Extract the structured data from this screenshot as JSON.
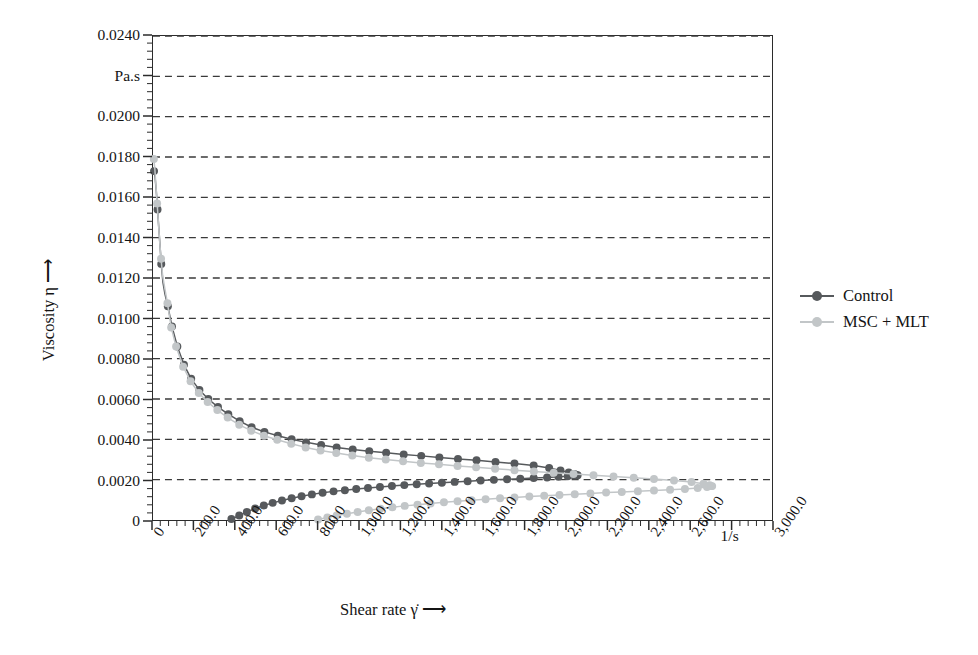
{
  "chart_data": {
    "type": "line",
    "title": "",
    "xlabel": "Shear rate γ̇  ⟶",
    "ylabel": "Viscosity η  ⟶",
    "x_unit": "1/s",
    "y_unit": "Pa.s",
    "xlim": [
      0,
      3000
    ],
    "ylim": [
      0,
      0.024
    ],
    "x_major_step": 200,
    "x_minor_per_major": 5,
    "y_major_step": 0.002,
    "y_minor_per_major": 4,
    "grid": "horizontal-dashed",
    "legend_position": "right",
    "xticklabels": [
      "0",
      "200.0",
      "400.0",
      "600.0",
      "800.0",
      "1,000.0",
      "1,200.0",
      "1,400.0",
      "1,600.0",
      "1,800.0",
      "2,000.0",
      "2,200.0",
      "2,400.0",
      "2,600.0",
      "1/s",
      "3,000.0"
    ],
    "xtickvalues": [
      0,
      200,
      400,
      600,
      800,
      1000,
      1200,
      1400,
      1600,
      1800,
      2000,
      2200,
      2400,
      2600,
      2800,
      3000
    ],
    "yticklabels": [
      "0",
      "0.0020",
      "0.0040",
      "0.0060",
      "0.0080",
      "0.0100",
      "0.0120",
      "0.0140",
      "0.0160",
      "0.0180",
      "0.0200",
      "Pa.s",
      "0.0240"
    ],
    "ytickvalues": [
      0,
      0.002,
      0.004,
      0.006,
      0.008,
      0.01,
      0.012,
      0.014,
      0.016,
      0.018,
      0.02,
      0.022,
      0.024
    ],
    "colors": {
      "control": "#56595c",
      "msc_mlt": "#c2c6c8",
      "axis": "#2b2b2b",
      "grid": "#3a3a3a",
      "text": "#141414",
      "background": "#ffffff"
    },
    "series": [
      {
        "name": "Control",
        "color": "#56595c",
        "branch": "down-sweep (ramp down)",
        "points": [
          [
            5,
            0.0173
          ],
          [
            10,
            0.017
          ],
          [
            16,
            0.0163
          ],
          [
            22,
            0.0154
          ],
          [
            28,
            0.0145
          ],
          [
            34,
            0.0136
          ],
          [
            40,
            0.0127
          ],
          [
            48,
            0.0118
          ],
          [
            58,
            0.0112
          ],
          [
            72,
            0.0106
          ],
          [
            92,
            0.0096
          ],
          [
            118,
            0.0086
          ],
          [
            150,
            0.0077
          ],
          [
            185,
            0.007
          ],
          [
            225,
            0.00645
          ],
          [
            268,
            0.006
          ],
          [
            315,
            0.0056
          ],
          [
            365,
            0.00525
          ],
          [
            420,
            0.0049
          ],
          [
            478,
            0.0046
          ],
          [
            540,
            0.00437
          ],
          [
            605,
            0.00418
          ],
          [
            672,
            0.004
          ],
          [
            742,
            0.00385
          ],
          [
            815,
            0.00372
          ],
          [
            890,
            0.0036
          ],
          [
            968,
            0.0035
          ],
          [
            1048,
            0.00341
          ],
          [
            1130,
            0.00333
          ],
          [
            1215,
            0.00325
          ],
          [
            1300,
            0.00318
          ],
          [
            1388,
            0.0031
          ],
          [
            1478,
            0.00303
          ],
          [
            1568,
            0.00296
          ],
          [
            1660,
            0.00288
          ],
          [
            1752,
            0.0028
          ],
          [
            1845,
            0.0027
          ],
          [
            1920,
            0.00258
          ],
          [
            1975,
            0.00246
          ],
          [
            2015,
            0.00235
          ],
          [
            2042,
            0.00228
          ],
          [
            2055,
            0.00222
          ]
        ]
      },
      {
        "name": "Control",
        "color": "#56595c",
        "branch": "up-sweep (ramp up)",
        "points": [
          [
            380,
            5e-05
          ],
          [
            418,
            0.00022
          ],
          [
            455,
            0.0004
          ],
          [
            495,
            0.00057
          ],
          [
            537,
            0.00072
          ],
          [
            580,
            0.00085
          ],
          [
            625,
            0.00097
          ],
          [
            672,
            0.00108
          ],
          [
            720,
            0.00118
          ],
          [
            770,
            0.00127
          ],
          [
            822,
            0.00135
          ],
          [
            875,
            0.00142
          ],
          [
            930,
            0.00148
          ],
          [
            985,
            0.00154
          ],
          [
            1042,
            0.00159
          ],
          [
            1100,
            0.00164
          ],
          [
            1158,
            0.00169
          ],
          [
            1218,
            0.00173
          ],
          [
            1278,
            0.00177
          ],
          [
            1338,
            0.00181
          ],
          [
            1400,
            0.00185
          ],
          [
            1462,
            0.00189
          ],
          [
            1525,
            0.00192
          ],
          [
            1588,
            0.00196
          ],
          [
            1652,
            0.00199
          ],
          [
            1716,
            0.00202
          ],
          [
            1780,
            0.00205
          ],
          [
            1845,
            0.00208
          ],
          [
            1910,
            0.00211
          ],
          [
            1965,
            0.00214
          ],
          [
            2010,
            0.00217
          ],
          [
            2042,
            0.0022
          ],
          [
            2058,
            0.00222
          ]
        ]
      },
      {
        "name": "MSC + MLT",
        "color": "#c2c6c8",
        "branch": "down-sweep (ramp down)",
        "points": [
          [
            4,
            0.0179
          ],
          [
            9,
            0.0174
          ],
          [
            14,
            0.0166
          ],
          [
            20,
            0.0157
          ],
          [
            26,
            0.0148
          ],
          [
            32,
            0.01385
          ],
          [
            39,
            0.01295
          ],
          [
            47,
            0.0121
          ],
          [
            57,
            0.0115
          ],
          [
            70,
            0.01075
          ],
          [
            88,
            0.00955
          ],
          [
            112,
            0.0086
          ],
          [
            146,
            0.0076
          ],
          [
            182,
            0.00688
          ],
          [
            222,
            0.0063
          ],
          [
            265,
            0.00585
          ],
          [
            312,
            0.00545
          ],
          [
            362,
            0.00508
          ],
          [
            418,
            0.00472
          ],
          [
            476,
            0.00443
          ],
          [
            538,
            0.00418
          ],
          [
            602,
            0.00398
          ],
          [
            670,
            0.00378
          ],
          [
            740,
            0.0036
          ],
          [
            812,
            0.00345
          ],
          [
            888,
            0.00332
          ],
          [
            966,
            0.0032
          ],
          [
            1046,
            0.00309
          ],
          [
            1128,
            0.003
          ],
          [
            1212,
            0.00291
          ],
          [
            1298,
            0.00283
          ],
          [
            1386,
            0.00276
          ],
          [
            1476,
            0.00268
          ],
          [
            1566,
            0.00261
          ],
          [
            1658,
            0.00254
          ],
          [
            1752,
            0.00247
          ],
          [
            1846,
            0.0024
          ],
          [
            1942,
            0.00234
          ],
          [
            2038,
            0.00228
          ],
          [
            2135,
            0.00222
          ],
          [
            2232,
            0.00216
          ],
          [
            2330,
            0.0021
          ],
          [
            2428,
            0.00203
          ],
          [
            2525,
            0.00196
          ],
          [
            2610,
            0.00188
          ],
          [
            2668,
            0.0018
          ],
          [
            2698,
            0.00173
          ],
          [
            2710,
            0.00168
          ]
        ]
      },
      {
        "name": "MSC + MLT",
        "color": "#c2c6c8",
        "branch": "up-sweep (ramp up)",
        "points": [
          [
            800,
            3e-05
          ],
          [
            845,
            0.00012
          ],
          [
            890,
            0.00022
          ],
          [
            940,
            0.00031
          ],
          [
            992,
            0.0004
          ],
          [
            1046,
            0.00048
          ],
          [
            1102,
            0.00056
          ],
          [
            1160,
            0.00063
          ],
          [
            1220,
            0.0007
          ],
          [
            1282,
            0.00076
          ],
          [
            1345,
            0.00082
          ],
          [
            1410,
            0.00088
          ],
          [
            1476,
            0.00093
          ],
          [
            1544,
            0.00098
          ],
          [
            1612,
            0.00103
          ],
          [
            1682,
            0.00108
          ],
          [
            1752,
            0.00112
          ],
          [
            1824,
            0.00116
          ],
          [
            1896,
            0.0012
          ],
          [
            1970,
            0.00124
          ],
          [
            2044,
            0.00128
          ],
          [
            2120,
            0.00132
          ],
          [
            2196,
            0.00136
          ],
          [
            2272,
            0.00139
          ],
          [
            2350,
            0.00143
          ],
          [
            2428,
            0.00146
          ],
          [
            2506,
            0.0015
          ],
          [
            2578,
            0.00154
          ],
          [
            2640,
            0.00159
          ],
          [
            2685,
            0.00164
          ],
          [
            2706,
            0.00168
          ]
        ]
      }
    ]
  },
  "legend": {
    "items": [
      {
        "label": "Control",
        "color": "#56595c"
      },
      {
        "label": "MSC + MLT",
        "color": "#c2c6c8"
      }
    ]
  }
}
